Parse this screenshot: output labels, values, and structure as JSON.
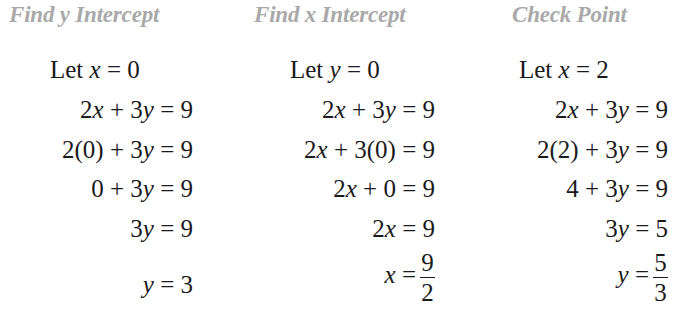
{
  "columns": [
    {
      "heading": "Find y Intercept",
      "let": {
        "prefix": "Let ",
        "var": "x",
        "rest": " = 0"
      },
      "steps": [
        "2x + 3y = 9",
        "2(0) + 3y = 9",
        "0 + 3y = 9",
        "3y = 9"
      ],
      "result": {
        "var": "y",
        "eq": " = 3"
      }
    },
    {
      "heading": "Find x Intercept",
      "let": {
        "prefix": "Let ",
        "var": "y",
        "rest": " = 0"
      },
      "steps": [
        "2x + 3y = 9",
        "2x + 3(0) = 9",
        "2x + 0 = 9",
        "2x = 9"
      ],
      "result": {
        "var": "x",
        "eq": " =",
        "num": "9",
        "den": "2"
      }
    },
    {
      "heading": "Check Point",
      "let": {
        "prefix": "Let ",
        "var": "x",
        "rest": " = 2"
      },
      "steps": [
        "2x + 3y = 9",
        "2(2) + 3y = 9",
        "4 + 3y = 9",
        "3y = 5"
      ],
      "result": {
        "var": "y",
        "eq": " =",
        "num": "5",
        "den": "3"
      }
    }
  ],
  "colors": {
    "heading": "#a9a9a9",
    "text": "#1a1a1a"
  }
}
